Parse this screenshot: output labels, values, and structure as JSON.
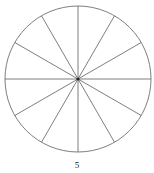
{
  "figure": {
    "caption": "5",
    "alt_label": "circle divided into twelve equal sectors",
    "background_color": "#ffffff",
    "stroke_color": "#6f6f6f",
    "center_dot_color": "#262626",
    "stroke_width": 0.9
  },
  "chart_data": {
    "type": "pie",
    "title": "",
    "subtitle": "",
    "xlabel": "",
    "ylabel": "",
    "legend_position": "none",
    "grid": false,
    "annotations": [
      "5"
    ],
    "geometry": {
      "center_x": 78,
      "center_y": 79,
      "radius": 73,
      "sector_count": 12,
      "sector_angle_degrees": 30,
      "diameter_line_count": 6,
      "first_spoke_angle_degrees": 90
    },
    "categories": [
      "sector-1",
      "sector-2",
      "sector-3",
      "sector-4",
      "sector-5",
      "sector-6",
      "sector-7",
      "sector-8",
      "sector-9",
      "sector-10",
      "sector-11",
      "sector-12"
    ],
    "values": [
      8.3333,
      8.3333,
      8.3333,
      8.3333,
      8.3333,
      8.3333,
      8.3333,
      8.3333,
      8.3333,
      8.3333,
      8.3333,
      8.3333
    ],
    "value_unit": "percent",
    "slice_angles_degrees": [
      30,
      30,
      30,
      30,
      30,
      30,
      30,
      30,
      30,
      30,
      30,
      30
    ],
    "spoke_angles_degrees": [
      0,
      30,
      60,
      90,
      120,
      150,
      180,
      210,
      240,
      270,
      300,
      330
    ],
    "slice_fill": "none",
    "slice_stroke": "#6f6f6f"
  }
}
